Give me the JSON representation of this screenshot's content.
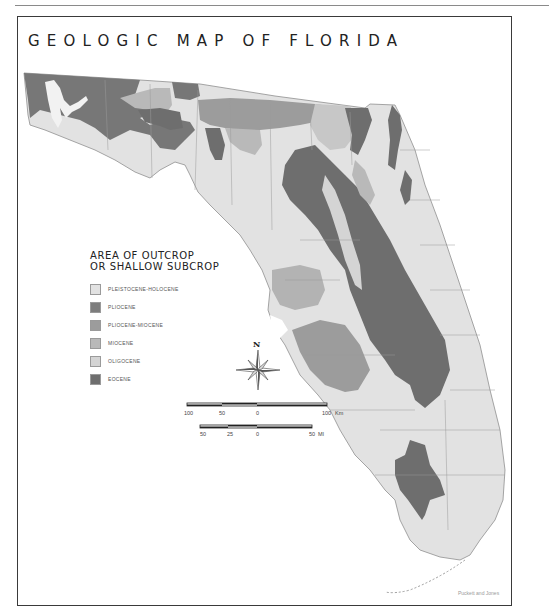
{
  "title": "GEOLOGIC MAP OF FLORIDA",
  "legend": {
    "heading_line1": "AREA OF OUTCROP",
    "heading_line2": "OR SHALLOW SUBCROP",
    "items": [
      {
        "label": "PLEISTOCENE-HOLOCENE",
        "color": "#e2e2e2"
      },
      {
        "label": "PLIOCENE",
        "color": "#7d7d7d"
      },
      {
        "label": "PLIOCENE-MIOCENE",
        "color": "#9c9c9c"
      },
      {
        "label": "MIOCENE",
        "color": "#b9b9b9"
      },
      {
        "label": "OLIGOCENE",
        "color": "#d4d4d4"
      },
      {
        "label": "EOCENE",
        "color": "#6e6e6e"
      }
    ]
  },
  "compass": {
    "north_label": "N"
  },
  "scale_km": {
    "ticks": [
      "100",
      "50",
      "0",
      "100"
    ],
    "unit": "Km"
  },
  "scale_mi": {
    "ticks": [
      "50",
      "25",
      "0",
      "50"
    ],
    "unit": "MI"
  },
  "credit": "Puckett and Jones",
  "colors": {
    "pleistocene_holocene": "#e2e2e2",
    "pliocene": "#7d7d7d",
    "pliocene_miocene": "#9c9c9c",
    "miocene": "#b9b9b9",
    "oligocene": "#d4d4d4",
    "eocene": "#6e6e6e",
    "county_lines": "#9a9a9a"
  }
}
